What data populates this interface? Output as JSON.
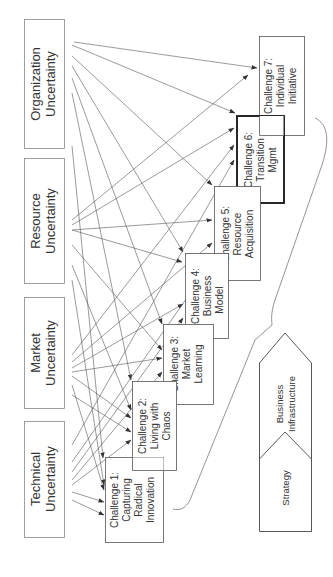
{
  "diagram": {
    "orientation": "rotated -90deg (text reads bottom-to-top)",
    "sources": [
      {
        "id": "organization",
        "line1": "Organization",
        "line2": "Uncertainty"
      },
      {
        "id": "resource",
        "line1": "Resource",
        "line2": "Uncertainty"
      },
      {
        "id": "market",
        "line1": "Market",
        "line2": "Uncertainty"
      },
      {
        "id": "technical",
        "line1": "Technical",
        "line2": "Uncertainty"
      }
    ],
    "challenges": [
      {
        "id": "c1",
        "lines": [
          "Challenge 1:",
          "Capturing",
          "Radical",
          "Innovation"
        ]
      },
      {
        "id": "c2",
        "lines": [
          "Challenge 2:",
          "Living with",
          "Chaos"
        ]
      },
      {
        "id": "c3",
        "lines": [
          "Challenge 3:",
          "Market",
          "Learning"
        ]
      },
      {
        "id": "c4",
        "lines": [
          "Challenge 4:",
          "Business",
          "Model"
        ]
      },
      {
        "id": "c5",
        "lines": [
          "Challenge 5:",
          "Resource",
          "Acquisition"
        ]
      },
      {
        "id": "c6",
        "lines": [
          "Challenge 6:",
          "Transition",
          "Mgmt"
        ],
        "emphasized": true
      },
      {
        "id": "c7",
        "lines": [
          "Challenge 7:",
          "Individual",
          "Initiative"
        ]
      }
    ],
    "chevron": {
      "lower": "Strategy",
      "upper_line1": "Business",
      "upper_line2": "Infrastructure"
    },
    "edges": "each uncertainty source has arrows to every challenge (many-to-many)",
    "colors": {
      "line": "#444444",
      "text": "#333333",
      "box_border": "#555555",
      "emphasis_border": "#111111"
    }
  }
}
